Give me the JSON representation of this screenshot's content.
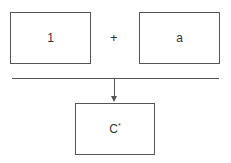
{
  "diagram": {
    "inputs": [
      {
        "label": "1"
      },
      {
        "label": "a"
      }
    ],
    "operator": "+",
    "output": {
      "base": "C",
      "superscript": "*"
    }
  }
}
